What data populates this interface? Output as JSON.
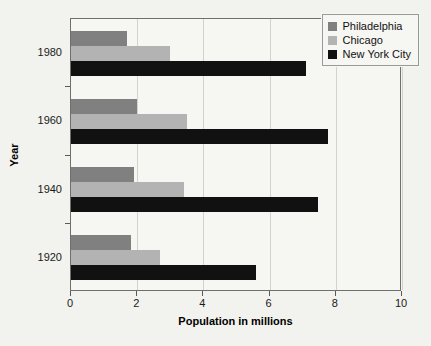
{
  "chart_data": {
    "type": "bar",
    "orientation": "horizontal",
    "title": "",
    "xlabel": "Population in millions",
    "ylabel": "Year",
    "categories": [
      "1980",
      "1960",
      "1940",
      "1920"
    ],
    "series": [
      {
        "name": "Philadelphia",
        "color": "#808080",
        "values": [
          1.7,
          2.0,
          1.9,
          1.8
        ]
      },
      {
        "name": "Chicago",
        "color": "#b3b3b3",
        "values": [
          3.0,
          3.5,
          3.4,
          2.7
        ]
      },
      {
        "name": "New York City",
        "color": "#111111",
        "values": [
          7.1,
          7.75,
          7.45,
          5.6
        ]
      }
    ],
    "xlim": [
      0,
      10
    ],
    "xticks": [
      "0",
      "2",
      "4",
      "6",
      "8",
      "10"
    ],
    "yticks": [
      "1920",
      "1940",
      "1960",
      "1980"
    ],
    "grid": true,
    "legend_position": "top-right"
  }
}
